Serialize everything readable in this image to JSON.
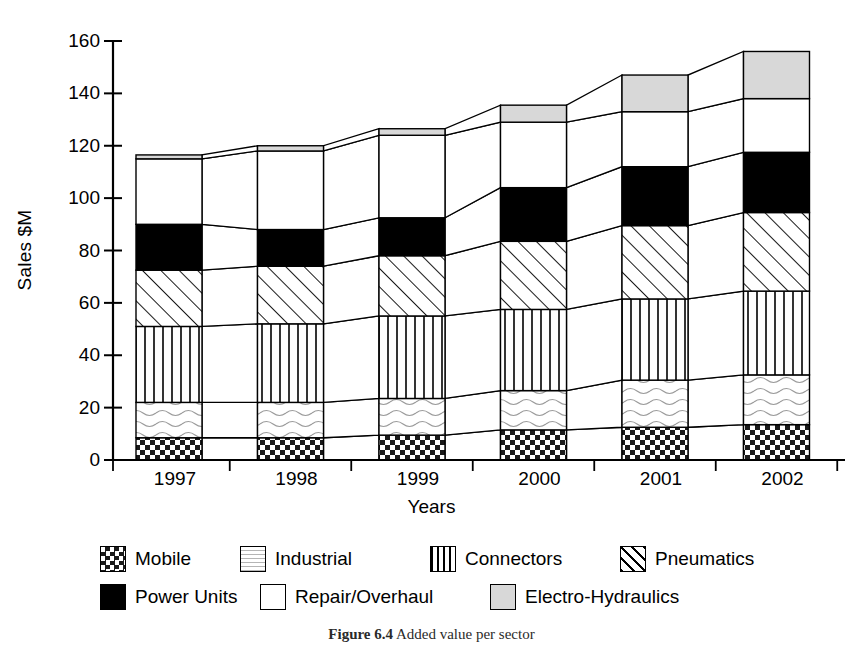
{
  "chart_data": {
    "type": "bar",
    "subtype": "stacked-bar-with-connectors",
    "title": "",
    "xlabel": "Years",
    "ylabel": "Sales $M",
    "categories": [
      "1997",
      "1998",
      "1999",
      "2000",
      "2001",
      "2002"
    ],
    "ylim": [
      0,
      160
    ],
    "yticks": [
      0,
      20,
      40,
      60,
      80,
      100,
      120,
      140,
      160
    ],
    "grid": false,
    "legend_position": "bottom",
    "stack_order_bottom_to_top": [
      "Mobile",
      "Industrial",
      "Connectors",
      "Pneumatics",
      "Power Units",
      "Repair/Overhaul",
      "Electro-Hydraulics"
    ],
    "series": [
      {
        "name": "Mobile",
        "pattern": "checkerboard",
        "values": [
          8.5,
          8.5,
          9.5,
          11.5,
          12.5,
          13.5
        ]
      },
      {
        "name": "Industrial",
        "pattern": "wavy-light",
        "values": [
          13.5,
          13.5,
          14.0,
          15.0,
          18.0,
          19.0
        ]
      },
      {
        "name": "Connectors",
        "pattern": "vertical-lines",
        "values": [
          29.0,
          30.0,
          31.5,
          31.0,
          31.0,
          32.0
        ]
      },
      {
        "name": "Pneumatics",
        "pattern": "diagonal-hatch",
        "values": [
          21.5,
          22.0,
          23.0,
          26.0,
          28.0,
          30.0
        ]
      },
      {
        "name": "Power Units",
        "pattern": "solid-black",
        "values": [
          17.5,
          14.0,
          14.5,
          20.5,
          22.5,
          23.0
        ]
      },
      {
        "name": "Repair/Overhaul",
        "pattern": "solid-white",
        "values": [
          25.0,
          30.0,
          31.5,
          25.0,
          21.0,
          20.5
        ]
      },
      {
        "name": "Electro-Hydraulics",
        "pattern": "light-gray",
        "values": [
          1.5,
          2.0,
          2.5,
          6.5,
          14.0,
          18.0
        ]
      }
    ],
    "totals": [
      116.5,
      120.0,
      126.5,
      135.5,
      147.0,
      156.0
    ]
  },
  "axes": {
    "y_title": "Sales $M",
    "x_title": "Years",
    "y_tick_labels": [
      "0",
      "20",
      "40",
      "60",
      "80",
      "100",
      "120",
      "140",
      "160"
    ],
    "x_tick_labels": [
      "1997",
      "1998",
      "1999",
      "2000",
      "2001",
      "2002"
    ]
  },
  "legend": {
    "row1": [
      {
        "label": "Mobile",
        "pattern": "checkerboard"
      },
      {
        "label": "Industrial",
        "pattern": "wavy-light"
      },
      {
        "label": "Connectors",
        "pattern": "vertical-lines"
      },
      {
        "label": "Pneumatics",
        "pattern": "diagonal-hatch"
      }
    ],
    "row2": [
      {
        "label": "Power Units",
        "pattern": "solid-black"
      },
      {
        "label": "Repair/Overhaul",
        "pattern": "solid-white"
      },
      {
        "label": "Electro-Hydraulics",
        "pattern": "light-gray"
      }
    ]
  },
  "caption": {
    "figure_number": "Figure 6.4",
    "text": "Added value per sector"
  },
  "colors": {
    "ink": "#000000",
    "light_gray": "#d8d8d8",
    "paper": "#ffffff"
  }
}
